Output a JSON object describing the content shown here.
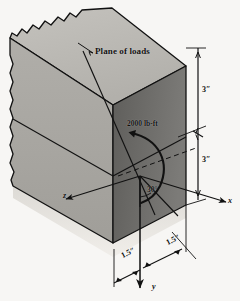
{
  "figure": {
    "kind": "engineering-diagram",
    "background_color": "#f7f6f4",
    "ink_color": "#111111",
    "face_colors": {
      "top": "#b9b7b2",
      "left_front": "#a9a7a2",
      "right_front": "#6f6e6b",
      "ground_shadow": "#cfccc6"
    }
  },
  "annotations": {
    "plane_of_loads": "Plane of loads",
    "moment": "2000 lb-ft",
    "angle": "30°"
  },
  "dimensions": {
    "vertical_top": "3″",
    "vertical_bottom": "3″",
    "horizontal_left": "1.5″",
    "horizontal_right": "1.5″"
  },
  "axes": {
    "x": "x",
    "y": "y",
    "z": "z"
  },
  "icons": {
    "leader_pointer": "leader-line-icon",
    "moment_arrow": "curved-moment-arrow-icon",
    "axis_arrow": "axis-arrowhead-icon",
    "dimension_tick": "dimension-tick-icon",
    "torn_edge": "torn-paper-edge-icon"
  }
}
